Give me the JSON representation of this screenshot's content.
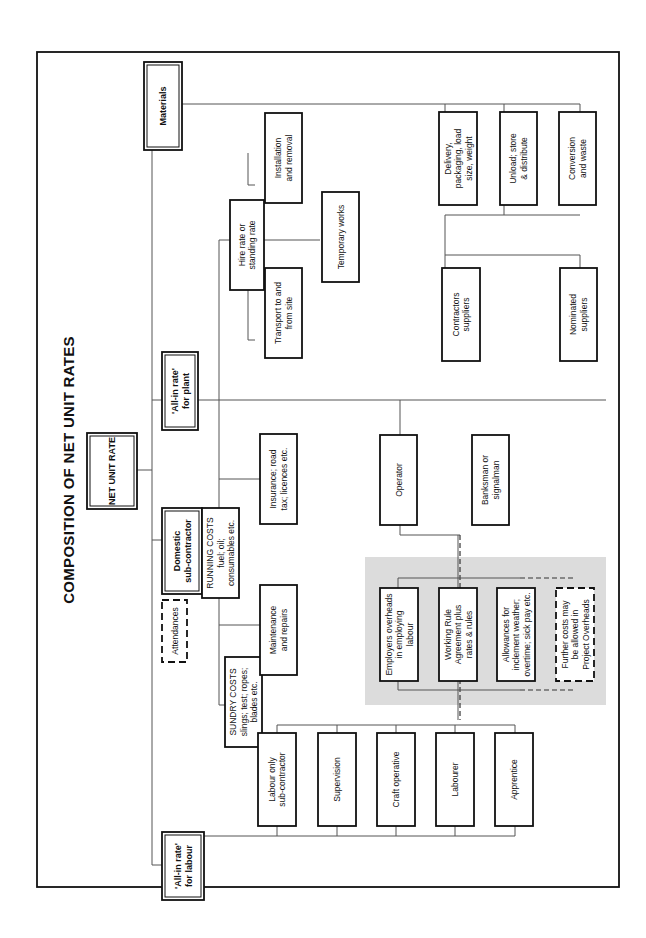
{
  "title": "COMPOSITION OF NET UNIT RATES",
  "root": "NET UNIT RATE",
  "level1": {
    "labour": [
      "'All-in rate'",
      "for labour"
    ],
    "domestic": [
      "Domestic",
      "sub-contractor"
    ],
    "plant": [
      "'All-in rate'",
      "for plant"
    ],
    "materials": [
      "Materials"
    ]
  },
  "attendances": "Attendances",
  "plant_costs": {
    "sundry": [
      "SUNDRY COSTS",
      "slings; test; ropes;",
      "blades etc."
    ],
    "running": [
      "RUNNING COSTS",
      "fuel; oil;",
      "consumables etc."
    ],
    "maintenance": [
      "Maintenance",
      "and repairs"
    ],
    "insurance": [
      "Insurance; road",
      "tax; licences etc."
    ],
    "operator": [
      "Operator"
    ],
    "banksman": [
      "Banksman or",
      "signalman"
    ],
    "hire": [
      "Hire rate or",
      "standing rate"
    ],
    "transport": [
      "Transport to and",
      "from site"
    ],
    "temporary": [
      "Temporary works"
    ],
    "installation": [
      "Installation",
      "and removal"
    ]
  },
  "materials_costs": {
    "delivery": [
      "Delivery,",
      "packaging, load",
      "size, weight"
    ],
    "unload": [
      "Unload; store",
      "& distribute"
    ],
    "conversion": [
      "Conversion",
      "and waste"
    ],
    "contractors": [
      "Contractors",
      "suppliers"
    ],
    "nominated": [
      "Nominated",
      "suppliers"
    ]
  },
  "overheads": {
    "employers": [
      "Employers overheads",
      "in employing",
      "labour"
    ],
    "working_rule": [
      "Working Rule",
      "Agreement plus",
      "rates & rules"
    ],
    "allowances": [
      "Allowances for",
      "inclement weather;",
      "overtime; sick pay etc."
    ],
    "further": [
      "Further costs may",
      "be allowed in",
      "Project Overheads"
    ]
  },
  "labour_types": {
    "labour_only": [
      "Labour only",
      "sub-contractor"
    ],
    "supervision": [
      "Supervision"
    ],
    "craft": [
      "Craft operative"
    ],
    "labourer": [
      "Labourer"
    ],
    "apprentice": [
      "Apprentice"
    ]
  },
  "colors": {
    "shade": "#dcdcdc",
    "line": "#555555",
    "box": "#111111"
  }
}
